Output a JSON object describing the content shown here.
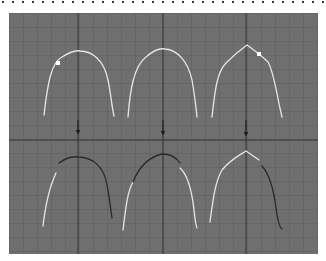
{
  "figure": {
    "colors": {
      "background": "#6f6f6f",
      "grid_minor": "#5a5a5a",
      "grid_major": "#303030",
      "curve_light": "#e6e6e6",
      "curve_dark": "#2a2a2a",
      "control_point": "#ffffff",
      "arrow": "#1a1a1a",
      "dots": "#3a3a3a"
    },
    "top_row": [
      {
        "id": "arch-smooth-with-point",
        "shape": "smooth arch",
        "control_point": "left shoulder"
      },
      {
        "id": "arch-smooth",
        "shape": "smooth arch",
        "control_point": "none"
      },
      {
        "id": "arch-peaked-with-point",
        "shape": "peaked arch",
        "control_point": "right shoulder"
      }
    ],
    "arrows": [
      {
        "id": "arrow-1",
        "direction": "down"
      },
      {
        "id": "arrow-2",
        "direction": "down"
      },
      {
        "id": "arrow-3",
        "direction": "down"
      }
    ],
    "bottom_row": [
      {
        "id": "arch-result-1",
        "shape": "smooth arch",
        "dark_segment": "top and right"
      },
      {
        "id": "arch-result-2",
        "shape": "smooth arch",
        "dark_segment": "top middle"
      },
      {
        "id": "arch-result-3",
        "shape": "peaked arch",
        "dark_segment": "right side"
      }
    ]
  }
}
